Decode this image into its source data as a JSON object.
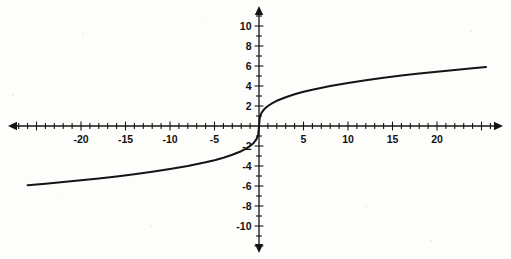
{
  "figure": {
    "background_color": "#fdfdfc",
    "ink_color": "#141414",
    "width": 511,
    "height": 259,
    "title": ""
  },
  "axes": {
    "origin_px": {
      "x": 259,
      "y": 126
    },
    "x_scale_px_per_unit": 8.9,
    "y_scale_px_per_unit": 10.0,
    "x_axis_name": "x-axis",
    "y_axis_name": "y-axis",
    "x_arrows": "both",
    "y_arrows": "both",
    "grid": "none",
    "minor_tick_step_x": 1,
    "minor_tick_step_y": 1,
    "major_tick_step_x": 5,
    "major_tick_step_y": 2
  },
  "chart_data": {
    "type": "line",
    "title": "",
    "subtitle": "",
    "xlabel": "",
    "ylabel": "",
    "xlim": [
      -26.5,
      26.5
    ],
    "ylim": [
      -11.5,
      11.5
    ],
    "grid": false,
    "legend": "none",
    "annotations": [],
    "x_tick_labels": [
      "-20",
      "-15",
      "-10",
      "-5",
      "5",
      "10",
      "15",
      "20"
    ],
    "x_tick_values": [
      -20,
      -15,
      -10,
      -5,
      5,
      10,
      15,
      20
    ],
    "y_tick_labels": [
      "10",
      "8",
      "6",
      "4",
      "2",
      "-2",
      "-4",
      "-6",
      "-8",
      "-10"
    ],
    "y_tick_values": [
      10,
      8,
      6,
      4,
      2,
      -2,
      -4,
      -6,
      -8,
      -10
    ],
    "series": [
      {
        "name": "y = 2 * cbrt(x)",
        "color": "#141414",
        "x": [
          -26,
          -24,
          -22,
          -20,
          -18,
          -16,
          -14,
          -12,
          -10,
          -8,
          -6,
          -5,
          -4,
          -3,
          -2,
          -1.5,
          -1,
          -0.6,
          -0.3,
          -0.1,
          0,
          0.1,
          0.3,
          0.6,
          1,
          1.5,
          2,
          3,
          4,
          5,
          6,
          8,
          10,
          12,
          14,
          16,
          18,
          20,
          22,
          24,
          25.5
        ],
        "y": [
          -5.92,
          -5.77,
          -5.6,
          -5.43,
          -5.24,
          -5.04,
          -4.82,
          -4.58,
          -4.31,
          -4.0,
          -3.63,
          -3.42,
          -3.17,
          -2.88,
          -2.52,
          -2.29,
          -2.0,
          -1.69,
          -1.34,
          -0.93,
          0,
          0.93,
          1.34,
          1.69,
          2.0,
          2.29,
          2.52,
          2.88,
          3.17,
          3.42,
          3.63,
          4.0,
          4.31,
          4.58,
          4.82,
          5.04,
          5.24,
          5.43,
          5.6,
          5.77,
          5.89
        ]
      }
    ]
  }
}
